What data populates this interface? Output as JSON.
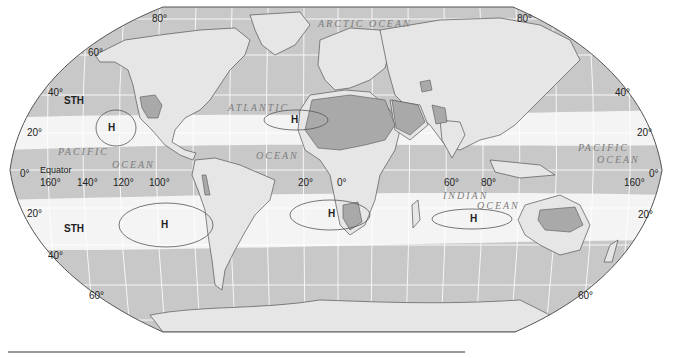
{
  "map": {
    "title": "Subtropical high pressure belts and deserts",
    "projection": "Robinson",
    "colors": {
      "ocean_gray": "#c8c8c8",
      "high_pressure_belt": "#f4f4f4",
      "land": "#e6e6e6",
      "desert": "#a9a9a9",
      "outline": "#555555",
      "graticule": "#ffffff"
    },
    "latitude_labels": {
      "n80_left": "80°",
      "n80_right": "80°",
      "n60_left": "60°",
      "n40_left": "40°",
      "n40_right": "40°",
      "n20_left": "20°",
      "n20_right": "20°",
      "eq_left": "0°",
      "eq_right": "0°",
      "s20_left": "20°",
      "s20_right": "20°",
      "s40_left": "40°",
      "s60_left": "60°",
      "s60_right": "60°"
    },
    "longitude_labels": {
      "w160": "160°",
      "w140": "140°",
      "w120": "120°",
      "w100": "100°",
      "w20": "20°",
      "zero": "0°",
      "e60": "60°",
      "e80": "80°",
      "e160": "160°"
    },
    "equator_label": "Equator",
    "belt_labels": {
      "north": "STH",
      "south": "STH"
    },
    "high_cells": [
      {
        "label": "H",
        "location": "North Pacific"
      },
      {
        "label": "H",
        "location": "North Atlantic"
      },
      {
        "label": "H",
        "location": "South Pacific"
      },
      {
        "label": "H",
        "location": "South Atlantic"
      },
      {
        "label": "H",
        "location": "Indian Ocean"
      }
    ],
    "ocean_labels": {
      "arctic": "ARCTIC   OCEAN",
      "atlantic": "ATLANTIC",
      "atlantic_ocean": "OCEAN",
      "pacific_w": "PACIFIC",
      "pacific_w_ocean": "OCEAN",
      "pacific_e": "PACIFIC",
      "pacific_e_ocean": "OCEAN",
      "indian": "INDIAN",
      "indian_ocean": "OCEAN"
    }
  }
}
